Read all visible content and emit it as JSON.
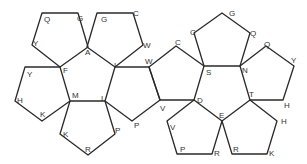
{
  "diagram": {
    "stroke_color": "#2a2a2a",
    "background": "#ffffff",
    "faces": [
      {
        "id": "face-1",
        "points": "42,13 78,13 88,47 60,67 32,45"
      },
      {
        "id": "face-2",
        "points": "97,13 133,13 143,45 115,67 87,47"
      },
      {
        "id": "face-3",
        "points": "25,67 60,67 70,101 42,121 15,101"
      },
      {
        "id": "face-4",
        "points": "70,101 105,101 115,134 88,155 60,134"
      },
      {
        "id": "face-5",
        "points": "115,67 149,67 160,100 132,121 105,101"
      },
      {
        "id": "face-6",
        "points": "149,67 176,46 204,66 194,100 160,100"
      },
      {
        "id": "face-7",
        "points": "194,33 222,13 250,33 240,66 204,66"
      },
      {
        "id": "face-8",
        "points": "240,66 266,46 294,66 283,100 250,100"
      },
      {
        "id": "face-9",
        "points": "194,100 222,121 212,154 177,154 167,121"
      },
      {
        "id": "face-10",
        "points": "250,100 277,121 267,154 232,154 222,121"
      }
    ],
    "labels": [
      {
        "text": "Q",
        "x": 44,
        "y": 22
      },
      {
        "text": "G",
        "x": 77,
        "y": 21
      },
      {
        "text": "Y",
        "x": 33,
        "y": 46
      },
      {
        "text": "A",
        "x": 85,
        "y": 55
      },
      {
        "text": "F",
        "x": 63,
        "y": 73
      },
      {
        "text": "G",
        "x": 101,
        "y": 22
      },
      {
        "text": "C",
        "x": 133,
        "y": 16
      },
      {
        "text": "W",
        "x": 143,
        "y": 48
      },
      {
        "text": "I",
        "x": 114,
        "y": 68
      },
      {
        "text": "W",
        "x": 145,
        "y": 64
      },
      {
        "text": "Y",
        "x": 27,
        "y": 77
      },
      {
        "text": "H",
        "x": 17,
        "y": 103
      },
      {
        "text": "K",
        "x": 40,
        "y": 117
      },
      {
        "text": "M",
        "x": 72,
        "y": 98
      },
      {
        "text": "I",
        "x": 101,
        "y": 101
      },
      {
        "text": "K",
        "x": 63,
        "y": 137
      },
      {
        "text": "R",
        "x": 85,
        "y": 152
      },
      {
        "text": "P",
        "x": 115,
        "y": 133
      },
      {
        "text": "P",
        "x": 134,
        "y": 128
      },
      {
        "text": "C",
        "x": 175,
        "y": 45
      },
      {
        "text": "V",
        "x": 160,
        "y": 111
      },
      {
        "text": "D",
        "x": 197,
        "y": 103
      },
      {
        "text": "S",
        "x": 206,
        "y": 75
      },
      {
        "text": "C",
        "x": 190,
        "y": 35
      },
      {
        "text": "G",
        "x": 229,
        "y": 16
      },
      {
        "text": "Q",
        "x": 250,
        "y": 36
      },
      {
        "text": "N",
        "x": 242,
        "y": 73
      },
      {
        "text": "Q",
        "x": 264,
        "y": 47
      },
      {
        "text": "Y",
        "x": 291,
        "y": 63
      },
      {
        "text": "H",
        "x": 284,
        "y": 108
      },
      {
        "text": "T",
        "x": 249,
        "y": 97
      },
      {
        "text": "E",
        "x": 219,
        "y": 118
      },
      {
        "text": "V",
        "x": 170,
        "y": 130
      },
      {
        "text": "P",
        "x": 180,
        "y": 152
      },
      {
        "text": "R",
        "x": 214,
        "y": 156
      },
      {
        "text": "H",
        "x": 281,
        "y": 124
      },
      {
        "text": "R",
        "x": 233,
        "y": 152
      },
      {
        "text": "K",
        "x": 269,
        "y": 156
      }
    ]
  }
}
